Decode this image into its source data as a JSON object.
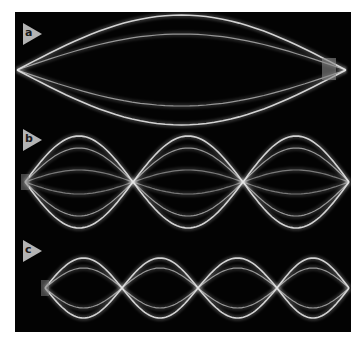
{
  "figure": {
    "background_color": "#030303",
    "string_color": "#e6e6e6",
    "label_color": "#b4b4b4",
    "panels": [
      {
        "label": "a",
        "loops": 1,
        "nodes_x": [
          17,
          346
        ],
        "center_y": 70,
        "amplitudes": [
          55,
          36
        ]
      },
      {
        "label": "b",
        "loops": 3,
        "nodes_x": [
          25,
          133,
          243,
          349
        ],
        "center_y": 182,
        "amplitudes": [
          46,
          34,
          12
        ]
      },
      {
        "label": "c",
        "loops": 4,
        "nodes_x": [
          45,
          122,
          198,
          277,
          349
        ],
        "center_y": 288,
        "amplitudes": [
          30,
          20
        ]
      }
    ]
  }
}
